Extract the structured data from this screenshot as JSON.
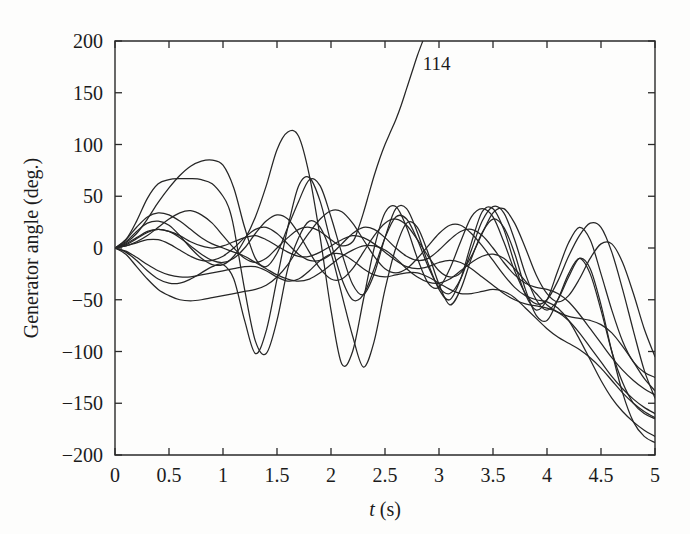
{
  "chart_data": {
    "type": "line",
    "title": "",
    "subtitle": "",
    "xlabel": "t (s)",
    "xlabel_italic_part": "t",
    "xlabel_rest": " (s)",
    "ylabel": "Generator angle (deg.)",
    "xlim": [
      0,
      5
    ],
    "ylim": [
      -200,
      200
    ],
    "grid": false,
    "legend": "none",
    "xticks": [
      0,
      0.5,
      1,
      1.5,
      2,
      2.5,
      3,
      3.5,
      4,
      4.5,
      5
    ],
    "xtick_labels": [
      "0",
      "0.5",
      "1",
      "1.5",
      "2",
      "2.5",
      "3",
      "3.5",
      "4",
      "4.5",
      "5"
    ],
    "yticks": [
      -200,
      -150,
      -100,
      -50,
      0,
      50,
      100,
      150,
      200
    ],
    "ytick_labels": [
      "−200",
      "−150",
      "−100",
      "−50",
      "0",
      "50",
      "100",
      "150",
      "200"
    ],
    "annotations": [
      {
        "text": "114",
        "x": 2.85,
        "y": 172,
        "description": "label on unstable generator curve leaving the top of the axes"
      }
    ],
    "series": [
      {
        "name": "gen-114-unstable",
        "comment": "Unstable machine: oscillates with the group until t~2.3 then accelerates monotonically off the top of the plot",
        "x": [
          0,
          0.1,
          0.2,
          0.3,
          0.4,
          0.5,
          0.6,
          0.7,
          0.8,
          0.9,
          1.0,
          1.1,
          1.2,
          1.3,
          1.4,
          1.5,
          1.6,
          1.7,
          1.8,
          1.9,
          2.0,
          2.1,
          2.2,
          2.25,
          2.3,
          2.35,
          2.4,
          2.45,
          2.5,
          2.55,
          2.6,
          2.65,
          2.7,
          2.75,
          2.8,
          2.85
        ],
        "y": [
          0,
          2,
          6,
          12,
          20,
          28,
          34,
          36,
          32,
          24,
          12,
          0,
          -10,
          -14,
          -10,
          0,
          10,
          18,
          20,
          16,
          8,
          2,
          6,
          18,
          34,
          52,
          70,
          86,
          100,
          112,
          124,
          138,
          154,
          170,
          186,
          200
        ]
      },
      {
        "name": "gen-A",
        "comment": "Large early swing to +67 deg at t~0.8, then large oscillation and slow downward drift",
        "x": [
          0,
          0.1,
          0.2,
          0.3,
          0.4,
          0.5,
          0.6,
          0.7,
          0.8,
          0.9,
          1.0,
          1.05,
          1.1,
          1.2,
          1.3,
          1.4,
          1.5,
          1.6,
          1.7,
          1.8,
          1.9,
          2.0,
          2.1,
          2.2,
          2.3,
          2.4,
          2.5,
          2.6,
          2.7,
          2.8,
          2.9,
          3.0,
          3.1,
          3.2,
          3.3,
          3.4,
          3.5,
          3.6,
          3.7,
          3.8,
          3.9,
          4.0,
          4.1,
          4.2,
          4.3,
          4.4,
          4.5,
          4.6,
          4.7,
          4.8,
          4.9,
          5.0
        ],
        "y": [
          0,
          8,
          26,
          48,
          62,
          66,
          67,
          67,
          66,
          62,
          50,
          40,
          20,
          -40,
          -90,
          -102,
          -70,
          -20,
          10,
          26,
          20,
          -5,
          -45,
          -85,
          -115,
          -90,
          -40,
          0,
          24,
          20,
          -5,
          -35,
          -55,
          -40,
          -10,
          15,
          28,
          20,
          -5,
          -40,
          -65,
          -70,
          -50,
          -25,
          -10,
          -25,
          -60,
          -100,
          -130,
          -150,
          -160,
          -165
        ]
      },
      {
        "name": "gen-B",
        "comment": "Rises to +85 deg near t=1.0 then swings down, sustained oscillation, drifts negative",
        "x": [
          0,
          0.1,
          0.2,
          0.3,
          0.4,
          0.5,
          0.6,
          0.7,
          0.8,
          0.9,
          1.0,
          1.1,
          1.2,
          1.3,
          1.4,
          1.5,
          1.6,
          1.7,
          1.8,
          1.9,
          2.0,
          2.1,
          2.2,
          2.3,
          2.4,
          2.5,
          2.6,
          2.7,
          2.8,
          2.9,
          3.0,
          3.1,
          3.2,
          3.3,
          3.4,
          3.5,
          3.6,
          3.7,
          3.8,
          3.9,
          4.0,
          4.1,
          4.2,
          4.3,
          4.4,
          4.5,
          4.6,
          4.7,
          4.8,
          4.9,
          5.0
        ],
        "y": [
          0,
          5,
          14,
          28,
          44,
          58,
          70,
          79,
          84,
          85,
          80,
          58,
          20,
          -10,
          -18,
          -5,
          20,
          45,
          66,
          60,
          30,
          -5,
          -35,
          -45,
          -25,
          10,
          38,
          38,
          15,
          -15,
          -40,
          -50,
          -30,
          5,
          35,
          38,
          18,
          -15,
          -45,
          -60,
          -50,
          -22,
          5,
          20,
          8,
          -25,
          -60,
          -90,
          -110,
          -120,
          -125
        ]
      },
      {
        "name": "gen-C",
        "comment": "Moderate positive swing peaking ~34 deg, then oscillating with slow downward trend",
        "x": [
          0,
          0.1,
          0.2,
          0.3,
          0.4,
          0.5,
          0.6,
          0.7,
          0.8,
          0.9,
          1.0,
          1.1,
          1.2,
          1.3,
          1.4,
          1.5,
          1.6,
          1.7,
          1.8,
          1.9,
          2.0,
          2.1,
          2.2,
          2.3,
          2.4,
          2.5,
          2.6,
          2.7,
          2.8,
          2.9,
          3.0,
          3.1,
          3.2,
          3.3,
          3.4,
          3.5,
          3.6,
          3.7,
          3.8,
          3.9,
          4.0,
          4.1,
          4.2,
          4.3,
          4.4,
          4.5,
          4.6,
          4.7,
          4.8,
          4.9,
          5.0
        ],
        "y": [
          0,
          8,
          20,
          30,
          34,
          32,
          26,
          18,
          10,
          4,
          0,
          -4,
          -8,
          -14,
          -20,
          -26,
          -30,
          -32,
          -30,
          -24,
          -16,
          -8,
          -2,
          2,
          2,
          -2,
          -10,
          -20,
          -28,
          -33,
          -34,
          -30,
          -22,
          -14,
          -8,
          -6,
          -10,
          -20,
          -32,
          -44,
          -55,
          -62,
          -66,
          -68,
          -70,
          -74,
          -82,
          -95,
          -110,
          -126,
          -138
        ]
      },
      {
        "name": "gen-D",
        "comment": "Stays near zero, oscillating at ~1.5 Hz with growing amplitude then decaying drift",
        "x": [
          0,
          0.1,
          0.2,
          0.3,
          0.4,
          0.5,
          0.6,
          0.7,
          0.8,
          0.9,
          1.0,
          1.1,
          1.2,
          1.3,
          1.4,
          1.5,
          1.6,
          1.7,
          1.8,
          1.9,
          2.0,
          2.1,
          2.2,
          2.3,
          2.4,
          2.5,
          2.6,
          2.7,
          2.8,
          2.9,
          3.0,
          3.1,
          3.2,
          3.3,
          3.4,
          3.5,
          3.6,
          3.7,
          3.8,
          3.9,
          4.0,
          4.1,
          4.2,
          4.3,
          4.4,
          4.5,
          4.6,
          4.7,
          4.8,
          4.9,
          5.0
        ],
        "y": [
          0,
          3,
          9,
          15,
          18,
          16,
          12,
          6,
          2,
          0,
          2,
          6,
          10,
          12,
          8,
          2,
          -4,
          -8,
          -8,
          -4,
          2,
          8,
          12,
          10,
          4,
          -4,
          -12,
          -18,
          -20,
          -18,
          -14,
          -12,
          -14,
          -20,
          -28,
          -36,
          -44,
          -50,
          -54,
          -56,
          -58,
          -62,
          -70,
          -82,
          -96,
          -110,
          -124,
          -136,
          -146,
          -154,
          -160
        ]
      },
      {
        "name": "gen-E",
        "comment": "Early negative dip to -50, later high-frequency oscillation, drifts to -180",
        "x": [
          0,
          0.1,
          0.2,
          0.3,
          0.4,
          0.5,
          0.6,
          0.7,
          0.8,
          0.9,
          1.0,
          1.1,
          1.2,
          1.3,
          1.4,
          1.5,
          1.6,
          1.7,
          1.8,
          1.9,
          2.0,
          2.1,
          2.2,
          2.3,
          2.4,
          2.5,
          2.6,
          2.7,
          2.8,
          2.9,
          3.0,
          3.1,
          3.2,
          3.3,
          3.4,
          3.5,
          3.6,
          3.7,
          3.8,
          3.9,
          4.0,
          4.1,
          4.2,
          4.3,
          4.4,
          4.5,
          4.6,
          4.7,
          4.8,
          4.9,
          5.0
        ],
        "y": [
          0,
          -6,
          -18,
          -30,
          -40,
          -46,
          -50,
          -51,
          -50,
          -48,
          -46,
          -44,
          -42,
          -40,
          -36,
          -28,
          -16,
          0,
          15,
          28,
          36,
          35,
          24,
          8,
          -8,
          -20,
          -24,
          -20,
          -10,
          2,
          14,
          22,
          22,
          14,
          2,
          -12,
          -26,
          -38,
          -46,
          -50,
          -52,
          -58,
          -70,
          -88,
          -108,
          -128,
          -145,
          -158,
          -168,
          -176,
          -182
        ]
      },
      {
        "name": "gen-F",
        "comment": "Strong negative first swing to -102 at t=1.3, recovers, oscillates, ends near -190",
        "x": [
          0,
          0.1,
          0.2,
          0.3,
          0.4,
          0.5,
          0.6,
          0.7,
          0.8,
          0.9,
          1.0,
          1.1,
          1.2,
          1.3,
          1.4,
          1.5,
          1.6,
          1.7,
          1.8,
          1.9,
          2.0,
          2.1,
          2.2,
          2.3,
          2.4,
          2.5,
          2.6,
          2.7,
          2.8,
          2.9,
          3.0,
          3.1,
          3.2,
          3.3,
          3.4,
          3.5,
          3.6,
          3.7,
          3.8,
          3.9,
          4.0,
          4.1,
          4.2,
          4.3,
          4.4,
          4.5,
          4.6,
          4.7,
          4.8,
          4.9,
          5.0
        ],
        "y": [
          0,
          -4,
          -12,
          -22,
          -30,
          -34,
          -34,
          -30,
          -24,
          -18,
          -16,
          -30,
          -70,
          -102,
          -80,
          -30,
          20,
          60,
          68,
          45,
          5,
          -30,
          -50,
          -45,
          -20,
          10,
          30,
          28,
          8,
          -18,
          -38,
          -44,
          -30,
          -2,
          26,
          40,
          34,
          8,
          -25,
          -50,
          -60,
          -50,
          -28,
          -10,
          -20,
          -55,
          -100,
          -140,
          -168,
          -182,
          -188
        ]
      },
      {
        "name": "gen-G",
        "comment": "Shallow negative swing, mid-band oscillations, steady downward ramp",
        "x": [
          0,
          0.1,
          0.2,
          0.3,
          0.4,
          0.5,
          0.6,
          0.7,
          0.8,
          0.9,
          1.0,
          1.1,
          1.2,
          1.3,
          1.4,
          1.5,
          1.6,
          1.7,
          1.8,
          1.9,
          2.0,
          2.1,
          2.2,
          2.3,
          2.4,
          2.5,
          2.6,
          2.7,
          2.8,
          2.9,
          3.0,
          3.1,
          3.2,
          3.3,
          3.4,
          3.5,
          3.6,
          3.7,
          3.8,
          3.9,
          4.0,
          4.1,
          4.2,
          4.3,
          4.4,
          4.5,
          4.6,
          4.7,
          4.8,
          4.9,
          5.0
        ],
        "y": [
          0,
          -3,
          -9,
          -16,
          -22,
          -26,
          -28,
          -28,
          -26,
          -24,
          -22,
          -20,
          -18,
          -18,
          -22,
          -28,
          -32,
          -30,
          -22,
          -12,
          -6,
          -6,
          -12,
          -20,
          -26,
          -28,
          -26,
          -24,
          -24,
          -28,
          -34,
          -40,
          -44,
          -44,
          -42,
          -40,
          -42,
          -48,
          -58,
          -68,
          -78,
          -86,
          -92,
          -98,
          -106,
          -116,
          -128,
          -140,
          -150,
          -158,
          -164
        ]
      },
      {
        "name": "gen-H",
        "comment": "Oscillates with amplitude ~40 deg around a slowly falling mean, large peak at t=3.5",
        "x": [
          0,
          0.1,
          0.2,
          0.3,
          0.4,
          0.5,
          0.6,
          0.7,
          0.8,
          0.9,
          1.0,
          1.1,
          1.2,
          1.3,
          1.4,
          1.5,
          1.6,
          1.7,
          1.8,
          1.9,
          2.0,
          2.1,
          2.2,
          2.3,
          2.4,
          2.5,
          2.6,
          2.7,
          2.8,
          2.9,
          3.0,
          3.1,
          3.2,
          3.3,
          3.4,
          3.5,
          3.6,
          3.7,
          3.8,
          3.9,
          4.0,
          4.1,
          4.2,
          4.3,
          4.4,
          4.5,
          4.6,
          4.7,
          4.8,
          4.9,
          5.0
        ],
        "y": [
          0,
          4,
          10,
          16,
          18,
          16,
          10,
          2,
          -6,
          -12,
          -14,
          -10,
          0,
          14,
          26,
          32,
          28,
          14,
          -4,
          -20,
          -30,
          -30,
          -20,
          -4,
          12,
          24,
          28,
          22,
          8,
          -8,
          -22,
          -28,
          -24,
          -8,
          14,
          34,
          38,
          24,
          0,
          -26,
          -44,
          -52,
          -46,
          -30,
          -10,
          4,
          4,
          -14,
          -44,
          -78,
          -105
        ]
      },
      {
        "name": "gen-I",
        "comment": "High-frequency mode, peaks near +112 deg at t=1.7, then mid-band oscillation trending down",
        "x": [
          0,
          0.1,
          0.2,
          0.3,
          0.4,
          0.5,
          0.6,
          0.7,
          0.8,
          0.9,
          1.0,
          1.1,
          1.2,
          1.3,
          1.4,
          1.5,
          1.6,
          1.7,
          1.8,
          1.9,
          2.0,
          2.1,
          2.2,
          2.3,
          2.4,
          2.5,
          2.6,
          2.7,
          2.8,
          2.9,
          3.0,
          3.1,
          3.2,
          3.3,
          3.4,
          3.5,
          3.6,
          3.7,
          3.8,
          3.9,
          4.0,
          4.1,
          4.2,
          4.3,
          4.4,
          4.5,
          4.6,
          4.7,
          4.8,
          4.9,
          5.0
        ],
        "y": [
          0,
          6,
          16,
          24,
          26,
          22,
          12,
          0,
          -10,
          -16,
          -16,
          -8,
          8,
          30,
          60,
          95,
          112,
          108,
          70,
          10,
          -60,
          -112,
          -100,
          -50,
          0,
          34,
          40,
          20,
          -10,
          -34,
          -38,
          -20,
          6,
          30,
          38,
          30,
          6,
          -22,
          -44,
          -54,
          -50,
          -32,
          -8,
          12,
          24,
          20,
          -4,
          -40,
          -80,
          -118,
          -145
        ]
      },
      {
        "name": "gen-J",
        "comment": "Slow mode staying in the -20 to +25 band early, then steepening downward trend",
        "x": [
          0,
          0.1,
          0.2,
          0.3,
          0.4,
          0.5,
          0.6,
          0.7,
          0.8,
          0.9,
          1.0,
          1.1,
          1.2,
          1.3,
          1.4,
          1.5,
          1.6,
          1.7,
          1.8,
          1.9,
          2.0,
          2.1,
          2.2,
          2.3,
          2.4,
          2.5,
          2.6,
          2.7,
          2.8,
          2.9,
          3.0,
          3.1,
          3.2,
          3.3,
          3.4,
          3.5,
          3.6,
          3.7,
          3.8,
          3.9,
          4.0,
          4.1,
          4.2,
          4.3,
          4.4,
          4.5,
          4.6,
          4.7,
          4.8,
          4.9,
          5.0
        ],
        "y": [
          0,
          2,
          5,
          8,
          8,
          4,
          -2,
          -8,
          -12,
          -12,
          -8,
          0,
          10,
          18,
          20,
          14,
          4,
          -6,
          -12,
          -12,
          -6,
          4,
          14,
          20,
          18,
          10,
          0,
          -8,
          -12,
          -10,
          -2,
          8,
          16,
          18,
          12,
          0,
          -14,
          -26,
          -34,
          -38,
          -40,
          -44,
          -52,
          -64,
          -78,
          -92,
          -106,
          -118,
          -128,
          -136,
          -142
        ]
      }
    ]
  },
  "figure": {
    "background_color": "#fdfdfc",
    "line_color": "#262626",
    "axis_color": "#2a2a2a",
    "text_color": "#1b1b1b"
  }
}
